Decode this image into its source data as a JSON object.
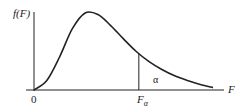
{
  "diagram": {
    "y_axis_label": "f(F)",
    "x_axis_label": "F",
    "origin_label": "0",
    "critical_value_label": {
      "base": "F",
      "subscript": "α"
    },
    "tail_area_label": "α",
    "colors": {
      "stroke": "#222222",
      "background": "#ffffff"
    }
  },
  "chart_data": {
    "type": "line",
    "title": "",
    "xlabel": "F",
    "ylabel": "f(F)",
    "series": [
      {
        "name": "F density curve",
        "x": [
          0,
          0.25,
          0.5,
          0.75,
          1.0,
          1.25,
          1.5,
          1.75,
          2.0,
          2.25,
          2.5,
          2.75,
          3.0,
          3.25,
          3.5
        ],
        "y": [
          0,
          0.12,
          0.42,
          0.78,
          0.98,
          0.96,
          0.82,
          0.65,
          0.49,
          0.36,
          0.26,
          0.18,
          0.12,
          0.07,
          0.03
        ]
      }
    ],
    "annotations": [
      {
        "type": "vertical-line",
        "x": 2.05,
        "label": "Fα"
      },
      {
        "type": "area-label",
        "x": 2.35,
        "label": "α"
      }
    ],
    "xlim": [
      0,
      3.8
    ],
    "ylim": [
      0,
      1.05
    ],
    "grid": false
  }
}
